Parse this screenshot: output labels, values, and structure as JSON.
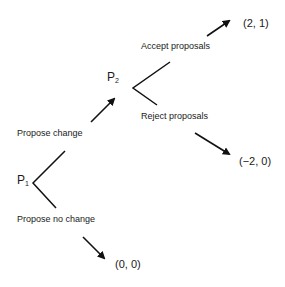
{
  "diagram": {
    "type": "extensive-form game tree",
    "nodes": [
      {
        "id": "P1",
        "player": "P",
        "subscript": "1"
      },
      {
        "id": "P2",
        "player": "P",
        "subscript": "2"
      }
    ],
    "actions": {
      "propose_change": "Propose change",
      "propose_no_change": "Propose no change",
      "accept_proposals": "Accept proposals",
      "reject_proposals": "Reject proposals"
    },
    "payoffs": {
      "accept": "(2, 1)",
      "reject": "(−2, 0)",
      "no_change": "(0, 0)"
    },
    "colors": {
      "line": "#111111",
      "background": "#ffffff"
    }
  }
}
